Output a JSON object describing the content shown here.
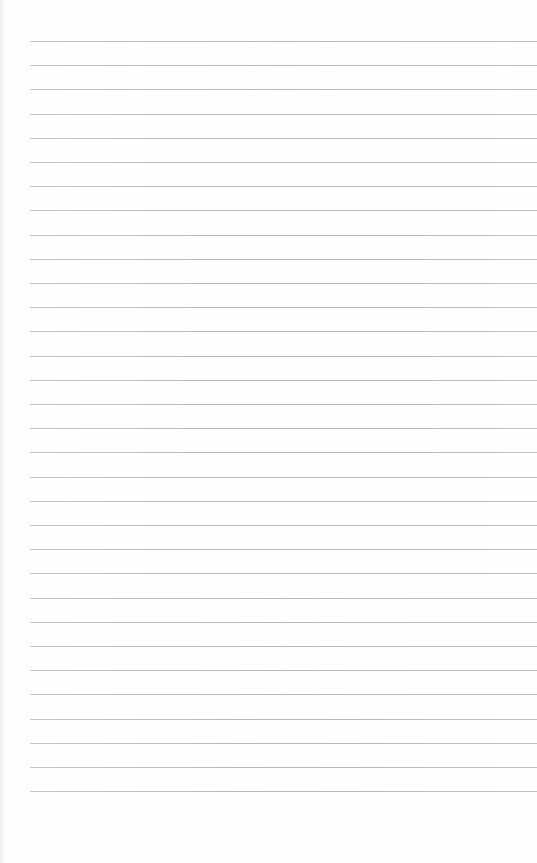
{
  "page": {
    "type": "lined-paper",
    "background_color": "#fefefe",
    "line_color": "#bdbdbd",
    "line_count": 32,
    "first_line_y": 41,
    "line_spacing": 24.2,
    "line_left": 30
  }
}
